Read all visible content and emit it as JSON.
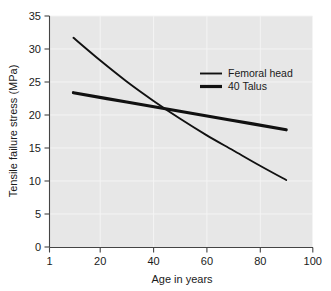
{
  "chart_data": {
    "type": "line",
    "title": "",
    "xlabel": "Age in years",
    "ylabel": "Tensile failure stress (MPa)",
    "xlim": [
      1,
      100
    ],
    "ylim": [
      0,
      35
    ],
    "xticks": [
      "1",
      "20",
      "40",
      "60",
      "80",
      "100"
    ],
    "xtick_values": [
      1,
      20,
      40,
      60,
      80,
      100
    ],
    "yticks": [
      "0",
      "5",
      "10",
      "15",
      "20",
      "25",
      "30",
      "35"
    ],
    "ytick_values": [
      0,
      5,
      10,
      15,
      20,
      25,
      30,
      35
    ],
    "grid": true,
    "legend_position": "upper-right-inside",
    "plot_background": "#e7e7e7",
    "figure_background": "#ffffff",
    "line_color": "#111111",
    "series": [
      {
        "name": "Femoral head",
        "style": "thin",
        "linewidth": 1.9,
        "x": [
          10,
          20,
          30,
          40,
          50,
          60,
          70,
          80,
          90
        ],
        "values": [
          31.7,
          28.3,
          25.1,
          22.2,
          19.5,
          17.0,
          14.7,
          12.4,
          10.2
        ]
      },
      {
        "name": "40 Talus",
        "style": "thick",
        "linewidth": 3.2,
        "x": [
          10,
          30,
          50,
          70,
          90
        ],
        "values": [
          23.4,
          22.0,
          20.6,
          19.2,
          17.8
        ]
      }
    ],
    "annotations": []
  },
  "legend": {
    "items": [
      {
        "label": "Femoral head",
        "swatch": "thin-line-swatch"
      },
      {
        "label": "40 Talus",
        "swatch": "thick-line-swatch"
      }
    ]
  },
  "axes": {
    "y_title": "Tensile failure stress (MPa)",
    "x_title": "Age in years"
  }
}
